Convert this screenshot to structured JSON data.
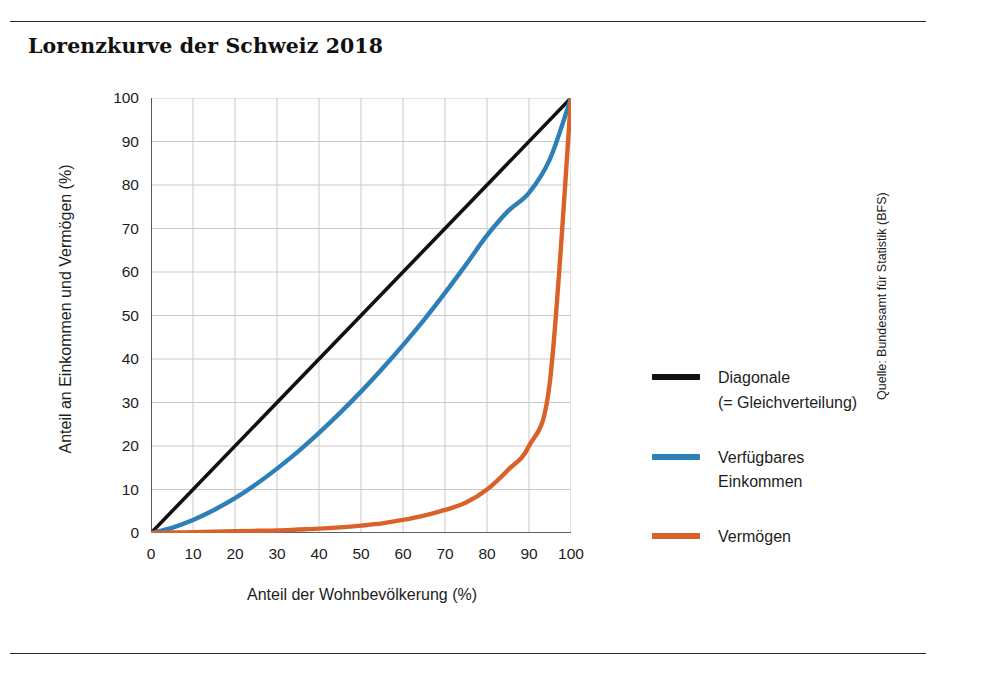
{
  "title": "Lorenzkurve der Schweiz 2018",
  "source": "Quelle: Bundesamt für Statistik (BFS)",
  "colors": {
    "diagonal": "#111111",
    "income": "#2d7fb8",
    "wealth": "#d9622b",
    "grid": "#c9c9c9",
    "axis": "#333333",
    "rule": "#2b2b2b"
  },
  "legend": {
    "items": [
      {
        "label": "Diagonale\n(= Gleichverteilung)",
        "color": "#111111",
        "key": "diagonale"
      },
      {
        "label": "Verfügbares\nEinkommen",
        "color": "#2d7fb8",
        "key": "verfuegbares-einkommen"
      },
      {
        "label": "Vermögen",
        "color": "#d9622b",
        "key": "vermoegen"
      }
    ]
  },
  "chart_data": {
    "type": "line",
    "title": "Lorenzkurve der Schweiz 2018",
    "xlabel": "Anteil der Wohnbevölkerung (%)",
    "ylabel": "Anteil an Einkommen und Vermögen (%)",
    "xlim": [
      0,
      100
    ],
    "ylim": [
      0,
      100
    ],
    "xticks": [
      0,
      10,
      20,
      30,
      40,
      50,
      60,
      70,
      80,
      90,
      100
    ],
    "yticks": [
      0,
      10,
      20,
      30,
      40,
      50,
      60,
      70,
      80,
      90,
      100
    ],
    "grid": true,
    "legend_position": "right",
    "x": [
      0,
      5,
      10,
      15,
      20,
      25,
      30,
      35,
      40,
      45,
      50,
      55,
      60,
      65,
      70,
      75,
      80,
      85,
      90,
      95,
      100
    ],
    "series": [
      {
        "name": "Diagonale (= Gleichverteilung)",
        "color": "#111111",
        "values": [
          0,
          5,
          10,
          15,
          20,
          25,
          30,
          35,
          40,
          45,
          50,
          55,
          60,
          65,
          70,
          75,
          80,
          85,
          90,
          95,
          100
        ]
      },
      {
        "name": "Verfügbares Einkommen",
        "color": "#2d7fb8",
        "values": [
          0,
          1.2,
          3.0,
          5.3,
          8.0,
          11.2,
          14.8,
          18.7,
          23.0,
          27.6,
          32.5,
          37.7,
          43.2,
          49.0,
          55.2,
          61.7,
          68.4,
          74.0,
          78.2,
          86.0,
          100
        ]
      },
      {
        "name": "Vermögen",
        "color": "#d9622b",
        "values": [
          0,
          0.1,
          0.2,
          0.3,
          0.4,
          0.5,
          0.6,
          0.8,
          1.0,
          1.3,
          1.7,
          2.2,
          3.0,
          4.0,
          5.3,
          7.0,
          10.0,
          14.5,
          20.0,
          35.0,
          100
        ]
      }
    ]
  },
  "axes": {
    "x_tick_labels": [
      "0",
      "10",
      "20",
      "30",
      "40",
      "50",
      "60",
      "70",
      "80",
      "90",
      "100"
    ],
    "y_tick_labels": [
      "0",
      "10",
      "20",
      "30",
      "40",
      "50",
      "60",
      "70",
      "80",
      "90",
      "100"
    ]
  }
}
